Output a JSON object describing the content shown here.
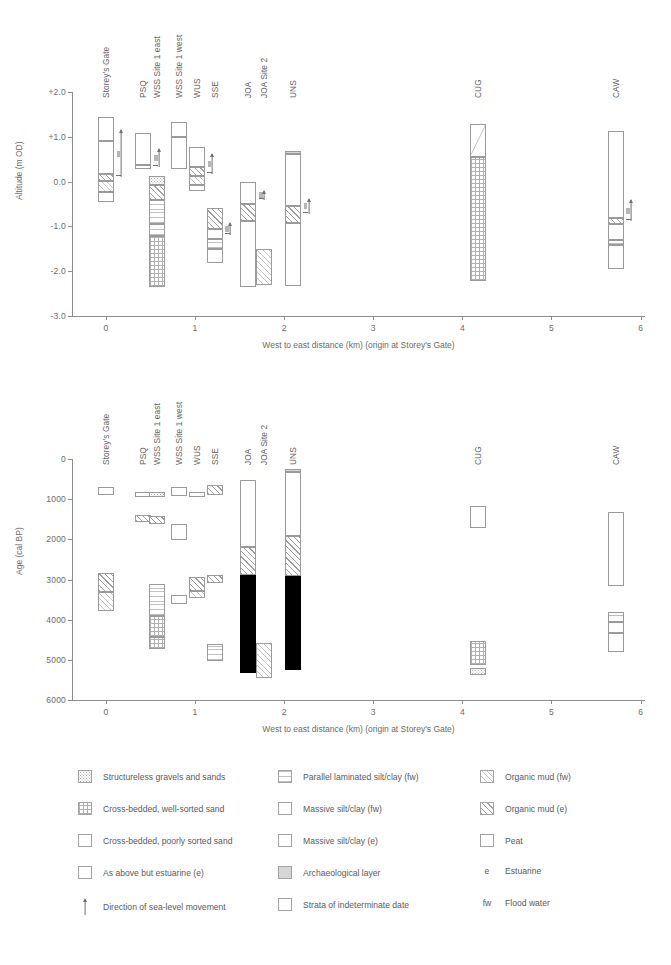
{
  "figure": {
    "panels": [
      {
        "id": "altitude",
        "ylabel": "Altitude (m OD)",
        "xlabel": "West to east distance (km) (origin at Storey's Gate)",
        "yticks": [
          "+2.0",
          "+1.0",
          "0.0",
          "-1.0",
          "-2.0",
          "-3.0"
        ],
        "xticks": [
          "0",
          "1",
          "2",
          "3",
          "4",
          "5",
          "6"
        ]
      },
      {
        "id": "age",
        "ylabel": "Age (cal BP)",
        "xlabel": "West to east distance (km) (origin at Storey's Gate)",
        "yticks": [
          "0",
          "1000",
          "2000",
          "3000",
          "4000",
          "5000",
          "6000"
        ],
        "xticks": [
          "0",
          "1",
          "2",
          "3",
          "4",
          "5",
          "6"
        ]
      }
    ],
    "sites": [
      "Storey's Gate",
      "PSQ",
      "WSS Site 1 east",
      "WSS Site 1 west",
      "WUS",
      "SSE",
      "JOA",
      "JOA Site 2",
      "UNS",
      "CUG",
      "CAW"
    ]
  },
  "chart_data": {
    "type": "bar",
    "title": "",
    "panels": [
      {
        "name": "altitude-profile",
        "ylabel": "Altitude (m OD)",
        "xlabel": "West to east distance (km) (origin at Storey's Gate)",
        "ylim": [
          -3.0,
          2.0
        ],
        "xlim": [
          -0.35,
          6.0
        ],
        "grid": false,
        "columns": [
          {
            "site": "Storey's Gate",
            "x": 0.0,
            "top": 1.45,
            "base": -0.45,
            "segments": [
              {
                "from": 1.45,
                "to": 0.9,
                "facies": "massive silt/clay (fw)"
              },
              {
                "from": 0.9,
                "to": 0.18,
                "facies": "massive silt/clay (e)"
              },
              {
                "from": 0.18,
                "to": 0.02,
                "facies": "organic mud (e)"
              },
              {
                "from": 0.02,
                "to": -0.23,
                "facies": "organic mud (fw)"
              },
              {
                "from": -0.23,
                "to": -0.45,
                "facies": "massive silt/clay (e)"
              }
            ],
            "arrow": {
              "from": 0.1,
              "to": 1.15,
              "direction": "up"
            }
          },
          {
            "site": "PSQ",
            "x": 0.42,
            "top": 1.08,
            "base": 0.28,
            "segments": [
              {
                "from": 1.08,
                "to": 0.38,
                "facies": "massive silt/clay (fw)"
              },
              {
                "from": 0.38,
                "to": 0.28,
                "facies": "strata of indeterminate date"
              }
            ],
            "arrow": {
              "from": 0.32,
              "to": 0.72,
              "direction": "up"
            }
          },
          {
            "site": "WSS Site 1 east",
            "x": 0.57,
            "top": 0.12,
            "base": -2.35,
            "segments": [
              {
                "from": 0.12,
                "to": -0.08,
                "facies": "structureless gravels and sands"
              },
              {
                "from": -0.08,
                "to": -0.42,
                "facies": "organic mud (e)"
              },
              {
                "from": -0.42,
                "to": -0.95,
                "facies": "parallel laminated silt/clay (fw)"
              },
              {
                "from": -0.95,
                "to": -1.22,
                "facies": "parallel laminated silt/clay (fw)"
              },
              {
                "from": -1.22,
                "to": -2.35,
                "facies": "cross-bedded, well-sorted sand"
              }
            ]
          },
          {
            "site": "WSS Site 1 west",
            "x": 0.82,
            "top": 1.33,
            "base": 0.28,
            "segments": [
              {
                "from": 1.33,
                "to": 1.0,
                "facies": "massive silt/clay (fw)"
              },
              {
                "from": 1.0,
                "to": 0.28,
                "facies": "massive silt/clay (e)"
              }
            ]
          },
          {
            "site": "WUS",
            "x": 1.02,
            "top": 0.78,
            "base": -0.2,
            "segments": [
              {
                "from": 0.78,
                "to": 0.33,
                "facies": "massive silt/clay (fw)"
              },
              {
                "from": 0.33,
                "to": 0.12,
                "facies": "organic mud (e)"
              },
              {
                "from": 0.12,
                "to": -0.08,
                "facies": "organic mud (fw)"
              },
              {
                "from": -0.08,
                "to": -0.2,
                "facies": "massive silt/clay (e)"
              }
            ],
            "arrow": {
              "from": 0.18,
              "to": 0.62,
              "direction": "up"
            }
          },
          {
            "site": "SSE",
            "x": 1.22,
            "top": -0.58,
            "base": -1.82,
            "segments": [
              {
                "from": -0.58,
                "to": -1.05,
                "facies": "organic mud (e)"
              },
              {
                "from": -1.05,
                "to": -1.28,
                "facies": "massive silt/clay (e)"
              },
              {
                "from": -1.28,
                "to": -1.5,
                "facies": "parallel laminated silt/clay (fw)"
              },
              {
                "from": -1.5,
                "to": -1.82,
                "facies": "massive silt/clay (fw)"
              }
            ],
            "arrow": {
              "from": -1.2,
              "to": -0.92,
              "direction": "up"
            }
          },
          {
            "site": "JOA",
            "x": 1.6,
            "top": -0.02,
            "base": -2.35,
            "segments": [
              {
                "from": -0.02,
                "to": -0.5,
                "facies": "massive silt/clay (fw)"
              },
              {
                "from": -0.5,
                "to": -0.88,
                "facies": "organic mud (e)"
              },
              {
                "from": -0.88,
                "to": -2.35,
                "facies": "massive silt/clay (e)"
              }
            ],
            "arrow": {
              "from": -0.42,
              "to": -0.2,
              "direction": "up"
            }
          },
          {
            "site": "JOA Site 2",
            "x": 1.78,
            "top": -1.5,
            "base": -2.3,
            "segments": [
              {
                "from": -1.5,
                "to": -2.3,
                "facies": "organic mud (fw)"
              }
            ]
          },
          {
            "site": "UNS",
            "x": 2.1,
            "top": 0.68,
            "base": -2.32,
            "segments": [
              {
                "from": 0.68,
                "to": 0.62,
                "facies": "archaeological layer"
              },
              {
                "from": 0.62,
                "to": -0.55,
                "facies": "massive silt/clay (fw)"
              },
              {
                "from": -0.55,
                "to": -0.92,
                "facies": "organic mud (e)"
              },
              {
                "from": -0.92,
                "to": -2.32,
                "facies": "massive silt/clay (e)"
              }
            ],
            "arrow": {
              "from": -0.72,
              "to": -0.38,
              "direction": "up"
            }
          },
          {
            "site": "CUG",
            "x": 4.18,
            "top": 1.28,
            "base": -2.22,
            "segments": [
              {
                "from": 1.28,
                "to": 0.55,
                "facies": "massive silt/clay (fw)"
              },
              {
                "from": 0.55,
                "to": -2.22,
                "facies": "cross-bedded, well-sorted sand"
              }
            ]
          },
          {
            "site": "CAW",
            "x": 5.72,
            "top": 1.12,
            "base": -1.95,
            "segments": [
              {
                "from": 1.12,
                "to": -0.82,
                "facies": "massive silt/clay (fw)"
              },
              {
                "from": -0.82,
                "to": -0.95,
                "facies": "organic mud (e)"
              },
              {
                "from": -0.95,
                "to": -1.3,
                "facies": "massive silt/clay (e)"
              },
              {
                "from": -1.3,
                "to": -1.42,
                "facies": "parallel laminated silt/clay (fw)"
              },
              {
                "from": -1.42,
                "to": -1.95,
                "facies": "massive silt/clay (fw)"
              }
            ],
            "arrow": {
              "from": -0.88,
              "to": -0.42,
              "direction": "up"
            }
          }
        ]
      },
      {
        "name": "age-profile",
        "ylabel": "Age (cal BP)",
        "xlabel": "West to east distance (km) (origin at Storey's Gate)",
        "ylim": [
          6000,
          0
        ],
        "xlim": [
          -0.35,
          6.0
        ],
        "grid": false,
        "columns": [
          {
            "site": "Storey's Gate",
            "x": 0.0,
            "segments": [
              {
                "from": 700,
                "to": 900,
                "facies": "massive silt/clay (e)"
              },
              {
                "from": 2850,
                "to": 3300,
                "facies": "organic mud (e)"
              },
              {
                "from": 3300,
                "to": 3780,
                "facies": "organic mud (fw)"
              }
            ]
          },
          {
            "site": "PSQ",
            "x": 0.42,
            "segments": [
              {
                "from": 820,
                "to": 950,
                "facies": "massive silt/clay (fw)"
              },
              {
                "from": 1400,
                "to": 1560,
                "facies": "organic mud (e)"
              }
            ]
          },
          {
            "site": "WSS Site 1 east",
            "x": 0.57,
            "segments": [
              {
                "from": 830,
                "to": 940,
                "facies": "structureless gravels and sands"
              },
              {
                "from": 1420,
                "to": 1620,
                "facies": "organic mud (e)"
              },
              {
                "from": 3100,
                "to": 3900,
                "facies": "parallel laminated silt/clay (fw)"
              },
              {
                "from": 3900,
                "to": 4420,
                "facies": "cross-bedded, well-sorted sand"
              },
              {
                "from": 4420,
                "to": 4720,
                "facies": "cross-bedded, well-sorted sand"
              }
            ]
          },
          {
            "site": "WSS Site 1 west",
            "x": 0.82,
            "segments": [
              {
                "from": 700,
                "to": 920,
                "facies": "massive silt/clay (e)"
              },
              {
                "from": 1620,
                "to": 2020,
                "facies": "massive silt/clay (fw)"
              },
              {
                "from": 3380,
                "to": 3600,
                "facies": "strata of indeterminate date"
              }
            ]
          },
          {
            "site": "WUS",
            "x": 1.02,
            "segments": [
              {
                "from": 820,
                "to": 940,
                "facies": "massive silt/clay (fw)"
              },
              {
                "from": 2950,
                "to": 3280,
                "facies": "organic mud (e)"
              },
              {
                "from": 3280,
                "to": 3460,
                "facies": "organic mud (fw)"
              }
            ]
          },
          {
            "site": "SSE",
            "x": 1.22,
            "segments": [
              {
                "from": 640,
                "to": 900,
                "facies": "organic mud (e)"
              },
              {
                "from": 2900,
                "to": 3080,
                "facies": "organic mud (e)"
              },
              {
                "from": 4600,
                "to": 5020,
                "facies": "parallel laminated silt/clay (fw)"
              }
            ]
          },
          {
            "site": "JOA",
            "x": 1.6,
            "segments": [
              {
                "from": 520,
                "to": 2200,
                "facies": "massive silt/clay (fw)"
              },
              {
                "from": 2200,
                "to": 2880,
                "facies": "organic mud (e)"
              },
              {
                "from": 2880,
                "to": 5340,
                "facies": "peat"
              }
            ]
          },
          {
            "site": "JOA Site 2",
            "x": 1.78,
            "segments": [
              {
                "from": 4580,
                "to": 5450,
                "facies": "organic mud (fw)"
              }
            ]
          },
          {
            "site": "UNS",
            "x": 2.1,
            "segments": [
              {
                "from": 250,
                "to": 320,
                "facies": "archaeological layer"
              },
              {
                "from": 320,
                "to": 1920,
                "facies": "massive silt/clay (fw)"
              },
              {
                "from": 1920,
                "to": 2920,
                "facies": "organic mud (e)"
              },
              {
                "from": 2920,
                "to": 5250,
                "facies": "peat"
              }
            ]
          },
          {
            "site": "CUG",
            "x": 4.18,
            "segments": [
              {
                "from": 1180,
                "to": 1720,
                "facies": "massive silt/clay (fw)"
              },
              {
                "from": 4520,
                "to": 5120,
                "facies": "cross-bedded, well-sorted sand"
              },
              {
                "from": 5200,
                "to": 5380,
                "facies": "structureless gravels and sands"
              }
            ]
          },
          {
            "site": "CAW",
            "x": 5.72,
            "segments": [
              {
                "from": 1320,
                "to": 3160,
                "facies": "massive silt/clay (fw)"
              },
              {
                "from": 3820,
                "to": 4060,
                "facies": "parallel laminated silt/clay (fw)"
              },
              {
                "from": 4060,
                "to": 4320,
                "facies": "massive silt/clay (e)"
              },
              {
                "from": 4320,
                "to": 4800,
                "facies": "massive silt/clay (fw)"
              }
            ]
          }
        ]
      }
    ]
  },
  "legend": {
    "column1": [
      {
        "swatch": "structureless-gravels-swatch",
        "label": "Structureless gravels and sands"
      },
      {
        "swatch": "cross-bedded-well-sorted-swatch",
        "label": "Cross-bedded, well-sorted sand"
      },
      {
        "swatch": "cross-bedded-poorly-sorted-swatch",
        "label": "Cross-bedded, poorly sorted sand"
      },
      {
        "swatch": "estuarine-variant-swatch",
        "label": "As above but estuarine (e)"
      },
      {
        "swatch": "sea-level-arrow-icon",
        "label": "Direction of sea-level movement"
      }
    ],
    "column2": [
      {
        "swatch": "parallel-laminated-swatch",
        "label": "Parallel laminated silt/clay (fw)"
      },
      {
        "swatch": "massive-silt-fw-swatch",
        "label": "Massive silt/clay (fw)"
      },
      {
        "swatch": "massive-silt-e-swatch",
        "label": "Massive silt/clay (e)"
      },
      {
        "swatch": "archaeological-layer-swatch",
        "label": "Archaeological layer"
      },
      {
        "swatch": "indeterminate-strata-swatch",
        "label": "Strata of indeterminate date"
      }
    ],
    "column3": [
      {
        "swatch": "organic-mud-fw-swatch",
        "label": "Organic mud (fw)"
      },
      {
        "swatch": "organic-mud-e-swatch",
        "label": "Organic mud (e)"
      },
      {
        "swatch": "peat-swatch",
        "label": "Peat"
      },
      {
        "abbr": "e",
        "label": "Estuarine"
      },
      {
        "abbr": "fw",
        "label": "Flood water"
      }
    ]
  }
}
